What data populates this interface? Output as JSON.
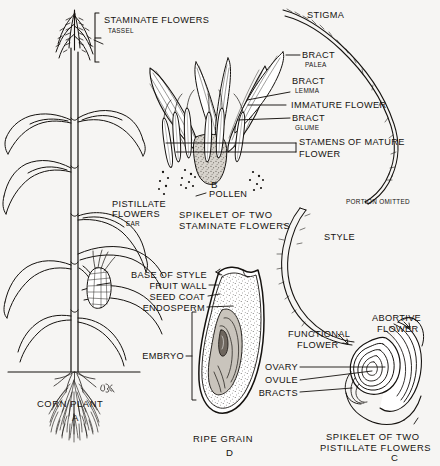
{
  "plate": {
    "title": "Corn Plant Structure Plate",
    "background_color": "#f6f5f3",
    "ink_color": "#15120f",
    "signature": "JR"
  },
  "figures": [
    {
      "key": "A",
      "letter": "A",
      "caption": "CORN PLANT"
    },
    {
      "key": "B",
      "letter": "B",
      "caption_line1": "SPIKELET OF TWO",
      "caption_line2": "STAMINATE FLOWERS"
    },
    {
      "key": "C",
      "letter": "C",
      "caption_line1": "SPIKELET OF TWO",
      "caption_line2": "PISTILLATE FLOWERS"
    },
    {
      "key": "D",
      "letter": "D",
      "caption": "RIPE GRAIN"
    }
  ],
  "labels": {
    "staminate_flowers": "STAMINATE FLOWERS",
    "tassel": "TASSEL",
    "pistillate_flowers_line1": "PISTILLATE",
    "pistillate_flowers_line2": "FLOWERS",
    "ear": "EAR",
    "stigma": "STIGMA",
    "bract_palea_main": "BRACT",
    "bract_palea_sub": "PALEA",
    "bract_lemma_main": "BRACT",
    "bract_lemma_sub": "LEMMA",
    "immature_flower": "IMMATURE FLOWER",
    "bract_glume_main": "BRACT",
    "bract_glume_sub": "GLUME",
    "stamens_line1": "STAMENS OF MATURE",
    "stamens_line2": "FLOWER",
    "pollen": "POLLEN",
    "portion_omitted": "PORTION OMITTED",
    "style": "STYLE",
    "base_of_style": "BASE OF STYLE",
    "fruit_wall": "FRUIT WALL",
    "seed_coat": "SEED COAT",
    "endosperm": "ENDOSPERM",
    "embryo": "EMBRYO",
    "functional_flower_line1": "FUNCTIONAL",
    "functional_flower_line2": "FLOWER",
    "abortive_flower_line1": "ABORTIVE",
    "abortive_flower_line2": "FLOWER",
    "ovary": "OVARY",
    "ovule": "OVULE",
    "bracts": "BRACTS"
  }
}
